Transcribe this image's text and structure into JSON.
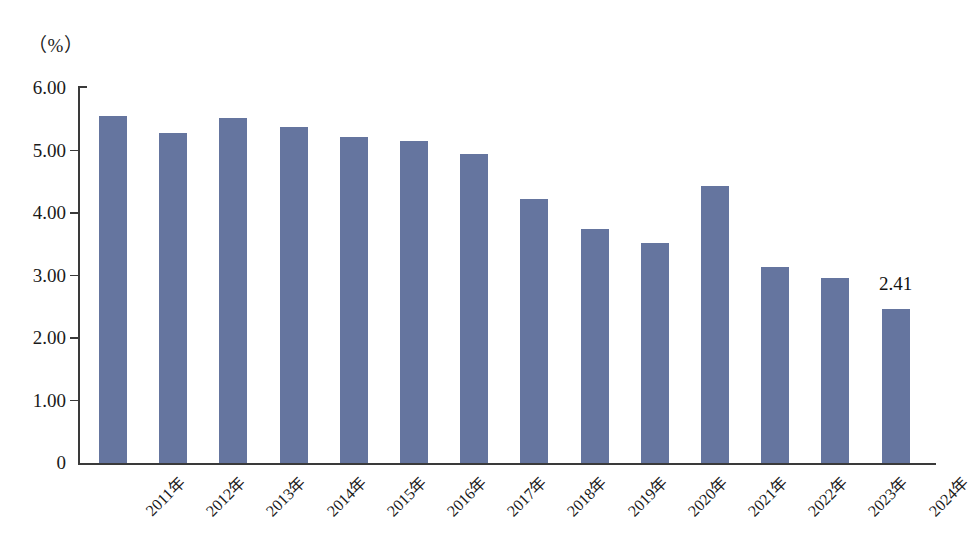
{
  "chart_data": {
    "type": "bar",
    "title": "",
    "subtitle": "",
    "unit_label": "（%）",
    "xlabel": "",
    "ylabel": "",
    "categories": [
      "2011年",
      "2012年",
      "2013年",
      "2014年",
      "2015年",
      "2016年",
      "2017年",
      "2018年",
      "2019年",
      "2020年",
      "2021年",
      "2022年",
      "2023年",
      "2024年"
    ],
    "values": [
      5.55,
      5.28,
      5.52,
      5.37,
      5.22,
      5.15,
      4.95,
      4.22,
      3.75,
      3.52,
      4.44,
      3.13,
      2.96,
      2.46
    ],
    "ylim": [
      0,
      6
    ],
    "ytick_labels": [
      "0",
      "1.00",
      "2.00",
      "3.00",
      "4.00",
      "5.00",
      "6.00"
    ],
    "ytick_values": [
      0,
      1,
      2,
      3,
      4,
      5,
      6
    ],
    "grid": false,
    "legend": null,
    "annotations": [
      {
        "text": "2.41",
        "category": "2024年",
        "value": 2.46
      }
    ],
    "series_color": "#65759f",
    "axis_color": "#3a3a3a"
  }
}
